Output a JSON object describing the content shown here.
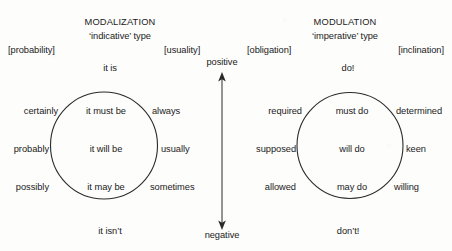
{
  "diagram": {
    "title_left": "MODALIZATION",
    "subtitle_left": "‘indicative’ type",
    "title_right": "MODULATION",
    "subtitle_right": "‘imperative’ type",
    "axis": {
      "positive": "positive",
      "negative": "negative"
    },
    "left_system": {
      "bracket_left": "[probability]",
      "bracket_right": "[usuality]",
      "top_pole": "it is",
      "bottom_pole": "it isn’t",
      "rows": [
        {
          "outer_left": "certainly",
          "inner": "it must be",
          "outer_right": "always"
        },
        {
          "outer_left": "probably",
          "inner": "it will be",
          "outer_right": "usually"
        },
        {
          "outer_left": "possibly",
          "inner": "it may be",
          "outer_right": "sometimes"
        }
      ]
    },
    "right_system": {
      "bracket_left": "[obligation]",
      "bracket_right": "[inclination]",
      "top_pole": "do!",
      "bottom_pole": "don’t!",
      "rows": [
        {
          "outer_left": "required",
          "inner": "must do",
          "outer_right": "determined"
        },
        {
          "outer_left": "supposed",
          "inner": "will do",
          "outer_right": "keen"
        },
        {
          "outer_left": "allowed",
          "inner": "may do",
          "outer_right": "willing"
        }
      ]
    },
    "colors": {
      "ink": "#1b1b1b",
      "stroke": "#2a2a2a",
      "background": "#fdfdfc"
    }
  }
}
